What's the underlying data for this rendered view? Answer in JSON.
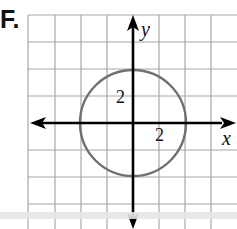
{
  "figure": {
    "label": "F.",
    "axes": {
      "x_label": "x",
      "y_label": "y"
    },
    "tick_labels": {
      "x_tick": "2",
      "y_tick": "2"
    },
    "grid": {
      "unit_px": 26.2,
      "origin_px": [
        133,
        123
      ],
      "x_range_units": [
        -4,
        4
      ],
      "y_range_units": [
        -3,
        4
      ],
      "grid_color": "#a8a8a8",
      "axis_color": "#000000"
    },
    "circle": {
      "center": [
        0,
        0
      ],
      "radius": 2,
      "color": "#707070"
    }
  }
}
